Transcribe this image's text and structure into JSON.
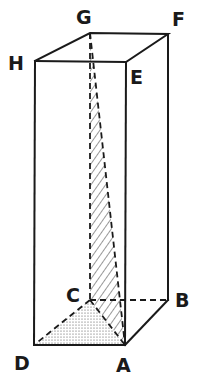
{
  "figure": {
    "type": "rectangular prism",
    "vertices": {
      "A": {
        "label": "A"
      },
      "B": {
        "label": "B"
      },
      "C": {
        "label": "C"
      },
      "D": {
        "label": "D"
      },
      "E": {
        "label": "E"
      },
      "F": {
        "label": "F"
      },
      "G": {
        "label": "G"
      },
      "H": {
        "label": "H"
      }
    },
    "shaded_regions": [
      {
        "name": "triangle ACG",
        "fill": "hatched"
      },
      {
        "name": "triangle ACD",
        "fill": "stippled"
      }
    ],
    "colors": {
      "stroke": "#1a1a1a",
      "background": "#ffffff"
    }
  }
}
